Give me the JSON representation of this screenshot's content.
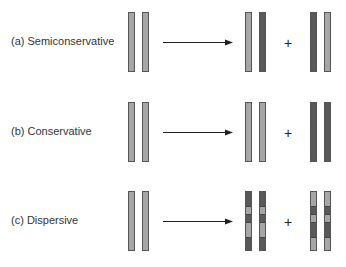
{
  "colors": {
    "parental_strand": "#a6a6a6",
    "new_strand": "#595959",
    "outline": "#555555",
    "arrow": "#222222",
    "text": "#333333"
  },
  "rows": [
    {
      "id": "a",
      "label": "(a) Semiconservative",
      "parent": [
        "light",
        "light"
      ],
      "daughter1": [
        "light",
        "dark"
      ],
      "plus": "+",
      "daughter2": [
        "dark",
        "light"
      ]
    },
    {
      "id": "b",
      "label": "(b) Conservative",
      "parent": [
        "light",
        "light"
      ],
      "daughter1": [
        "light",
        "light"
      ],
      "plus": "+",
      "daughter2": [
        "dark",
        "dark"
      ]
    },
    {
      "id": "c",
      "label": "(c) Dispersive",
      "parent": [
        "light",
        "light"
      ],
      "daughter1_segments": [
        "dark",
        "light",
        "dark",
        "light",
        "dark"
      ],
      "plus": "+",
      "daughter2_segments": [
        "light",
        "dark",
        "light",
        "dark",
        "light"
      ]
    }
  ]
}
